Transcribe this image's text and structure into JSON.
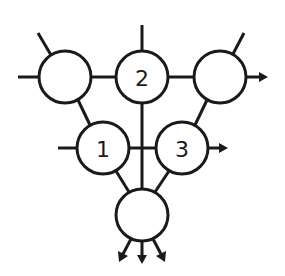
{
  "diagram": {
    "type": "node-graph",
    "colors": {
      "stroke": "#1a1a1a",
      "fill": "#ffffff",
      "background": "#ffffff"
    },
    "nodes": [
      {
        "id": "top-left",
        "label": ""
      },
      {
        "id": "node-2",
        "label": "2"
      },
      {
        "id": "top-right",
        "label": ""
      },
      {
        "id": "node-1",
        "label": "1"
      },
      {
        "id": "node-3",
        "label": "3"
      },
      {
        "id": "bottom",
        "label": ""
      }
    ],
    "edges": [
      {
        "from": "top-left",
        "to": "node-2"
      },
      {
        "from": "node-2",
        "to": "top-right"
      },
      {
        "from": "top-left",
        "to": "node-1"
      },
      {
        "from": "top-right",
        "to": "node-3"
      },
      {
        "from": "node-1",
        "to": "node-3"
      },
      {
        "from": "node-2",
        "to": "bottom"
      },
      {
        "from": "node-1",
        "to": "bottom"
      },
      {
        "from": "node-3",
        "to": "bottom"
      }
    ],
    "external_inputs": [
      "top-left (left)",
      "top-left (upper-left)",
      "node-2 (top)",
      "top-right (upper-right)",
      "node-1 (left)"
    ],
    "external_outputs": [
      "top-right (right arrow)",
      "node-3 (right arrow)",
      "bottom (three downward arrows)"
    ]
  }
}
